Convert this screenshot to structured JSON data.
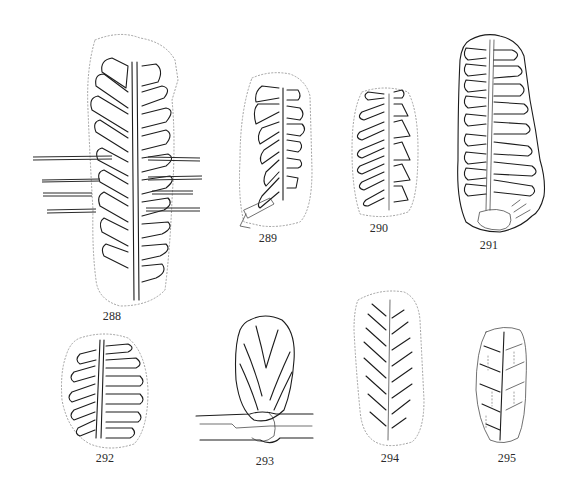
{
  "plate": {
    "background": "#ffffff",
    "ink_color": "#1c1c1c",
    "figures": [
      {
        "id": "288",
        "label": "288",
        "description": "elongate pinnate frond fragment crossed by horizontal stem lines"
      },
      {
        "id": "289",
        "label": "289",
        "description": "pinnate frond fragment with broken base"
      },
      {
        "id": "290",
        "label": "290",
        "description": "small oblong pinnate frond fragment"
      },
      {
        "id": "291",
        "label": "291",
        "description": "long narrow pinnate frond with rounded base"
      },
      {
        "id": "292",
        "label": "292",
        "description": "oval pinnate frond fragment"
      },
      {
        "id": "293",
        "label": "293",
        "description": "bud-like frond attached to horizontal stem"
      },
      {
        "id": "294",
        "label": "294",
        "description": "lanceolate pinnate frond with dotted outline"
      },
      {
        "id": "295",
        "label": "295",
        "description": "small narrow pinnate frond with stippled segments"
      }
    ]
  }
}
